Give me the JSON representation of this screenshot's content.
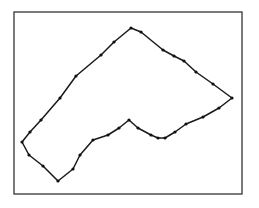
{
  "figure": {
    "frame": {
      "x": 14,
      "y": 12,
      "width": 228,
      "height": 182,
      "stroke": "#333333"
    },
    "polygon": {
      "stroke": "#1a1a1a",
      "vertex_color": "#111111",
      "points": [
        [
          22,
          142
        ],
        [
          29,
          155
        ],
        [
          43,
          166
        ],
        [
          58,
          181
        ],
        [
          73,
          169
        ],
        [
          80,
          155
        ],
        [
          93,
          140
        ],
        [
          108,
          135
        ],
        [
          119,
          128
        ],
        [
          129,
          120
        ],
        [
          138,
          128
        ],
        [
          151,
          135
        ],
        [
          158,
          138
        ],
        [
          165,
          138
        ],
        [
          175,
          132
        ],
        [
          186,
          124
        ],
        [
          203,
          117
        ],
        [
          219,
          108
        ],
        [
          232,
          98
        ],
        [
          213,
          84
        ],
        [
          196,
          72
        ],
        [
          184,
          61
        ],
        [
          174,
          56
        ],
        [
          163,
          50
        ],
        [
          141,
          32
        ],
        [
          131,
          28
        ],
        [
          114,
          42
        ],
        [
          101,
          55
        ],
        [
          76,
          76
        ],
        [
          60,
          98
        ],
        [
          41,
          120
        ],
        [
          30,
          132
        ]
      ]
    }
  }
}
